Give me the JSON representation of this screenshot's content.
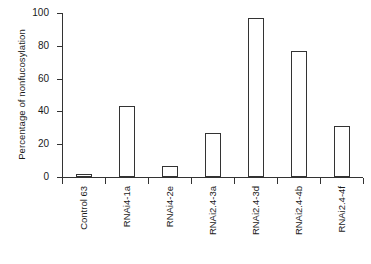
{
  "chart_data": {
    "type": "bar",
    "title": "",
    "xlabel": "",
    "ylabel": "Percentage of nonfucosylation",
    "categories": [
      "Control 63",
      "RNAi4-1a",
      "RNAi4-2e",
      "RNAi2.4-3a",
      "RNAi2.4-3d",
      "RNAi2.4-4b",
      "RNAi2.4-4f"
    ],
    "values": [
      2,
      43,
      6.5,
      27,
      97,
      77,
      31
    ],
    "ylim": [
      0,
      100
    ],
    "yticks": [
      0,
      20,
      40,
      60,
      80,
      100
    ],
    "ytick_labels": [
      "0",
      "20",
      "40",
      "60",
      "80",
      "100"
    ],
    "grid": false,
    "legend": false,
    "bar_style": {
      "fill": "#ffffff",
      "edge": "#333333"
    }
  }
}
